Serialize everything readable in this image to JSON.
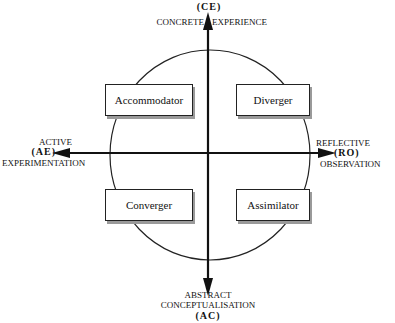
{
  "diagram": {
    "axes": {
      "top": {
        "code": "(CE)",
        "label_left": "CONCRETE",
        "label_right": "EXPERIENCE"
      },
      "left": {
        "line1": "ACTIVE",
        "code": "(AE)",
        "line2": "EXPERIMENTATION"
      },
      "right": {
        "line1": "REFLECTIVE",
        "code": "(RO)",
        "line2": "OBSERVATION"
      },
      "bottom": {
        "line1": "ABSTRACT",
        "line2": "CONCEPTUALISATION",
        "code": "(AC)"
      }
    },
    "quadrants": {
      "top_left": "Accommodator",
      "top_right": "Diverger",
      "bottom_left": "Converger",
      "bottom_right": "Assimilator"
    },
    "colors": {
      "line": "#111111",
      "shadow": "#9a9a9a",
      "background": "#ffffff"
    }
  }
}
